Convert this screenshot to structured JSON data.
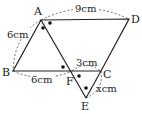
{
  "diagram": {
    "points": {
      "A": {
        "label": "A",
        "x": 41,
        "y": 20
      },
      "B": {
        "label": "B",
        "x": 13,
        "y": 71
      },
      "C": {
        "label": "C",
        "x": 101,
        "y": 71
      },
      "D": {
        "label": "D",
        "x": 129,
        "y": 19
      },
      "E": {
        "label": "E",
        "x": 86,
        "y": 98
      },
      "F": {
        "label": "F",
        "x": 72,
        "y": 71
      }
    },
    "measurements": {
      "AD": "9cm",
      "AB": "6cm",
      "BF": "6cm",
      "FC": "3cm",
      "CE": "xcm"
    },
    "angle_marks": "equal angles marked with dots at A (two), F (two), E (one)"
  }
}
